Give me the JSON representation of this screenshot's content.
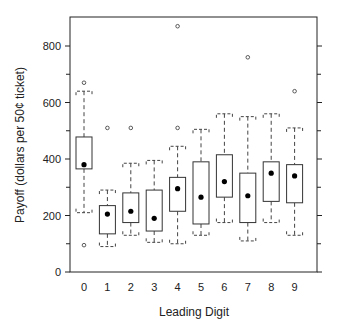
{
  "chart_data": {
    "type": "box",
    "title": "",
    "xlabel": "Leading Digit",
    "ylabel": "Payoff (dollars per 50¢ ticket)",
    "ylim": [
      0,
      900
    ],
    "yticks": [
      0,
      200,
      400,
      600,
      800
    ],
    "categories": [
      "0",
      "1",
      "2",
      "3",
      "4",
      "5",
      "6",
      "7",
      "8",
      "9"
    ],
    "boxes": [
      {
        "digit": "0",
        "whisker_low": 210,
        "q1": 365,
        "mean": 380,
        "q3": 478,
        "whisker_high": 640,
        "outliers": [
          95,
          670
        ]
      },
      {
        "digit": "1",
        "whisker_low": 90,
        "q1": 135,
        "mean": 205,
        "q3": 235,
        "whisker_high": 290,
        "outliers": [
          510
        ]
      },
      {
        "digit": "2",
        "whisker_low": 130,
        "q1": 175,
        "mean": 215,
        "q3": 280,
        "whisker_high": 385,
        "outliers": [
          510
        ]
      },
      {
        "digit": "3",
        "whisker_low": 105,
        "q1": 145,
        "mean": 190,
        "q3": 290,
        "whisker_high": 395,
        "outliers": []
      },
      {
        "digit": "4",
        "whisker_low": 100,
        "q1": 215,
        "mean": 295,
        "q3": 335,
        "whisker_high": 445,
        "outliers": [
          510,
          870
        ]
      },
      {
        "digit": "5",
        "whisker_low": 130,
        "q1": 170,
        "mean": 265,
        "q3": 390,
        "whisker_high": 505,
        "outliers": []
      },
      {
        "digit": "6",
        "whisker_low": 175,
        "q1": 265,
        "mean": 320,
        "q3": 415,
        "whisker_high": 560,
        "outliers": []
      },
      {
        "digit": "7",
        "whisker_low": 110,
        "q1": 175,
        "mean": 270,
        "q3": 350,
        "whisker_high": 550,
        "outliers": [
          760
        ]
      },
      {
        "digit": "8",
        "whisker_low": 175,
        "q1": 250,
        "mean": 350,
        "q3": 390,
        "whisker_high": 560,
        "outliers": []
      },
      {
        "digit": "9",
        "whisker_low": 130,
        "q1": 245,
        "mean": 340,
        "q3": 380,
        "whisker_high": 510,
        "outliers": [
          640
        ]
      }
    ],
    "grid": false,
    "legend": null
  },
  "labels": {
    "xlabel": "Leading Digit",
    "ylabel": "Payoff (dollars per 50¢ ticket)"
  }
}
